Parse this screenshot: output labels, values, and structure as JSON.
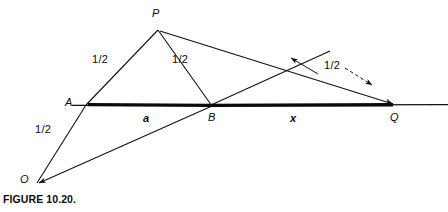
{
  "figure": {
    "caption": "FIGURE 10.20.",
    "points": [
      {
        "id": "P",
        "label": "P",
        "x": 158,
        "y": 29,
        "label_x": 153,
        "label_y": 10
      },
      {
        "id": "A",
        "label": "A",
        "x": 86,
        "y": 105,
        "label_x": 66,
        "label_y": 99
      },
      {
        "id": "B",
        "label": "B",
        "x": 212,
        "y": 106,
        "label_x": 209,
        "label_y": 114
      },
      {
        "id": "Q",
        "label": "Q",
        "x": 395,
        "y": 105,
        "label_x": 391,
        "label_y": 114
      },
      {
        "id": "O",
        "label": "O",
        "x": 37,
        "y": 183,
        "label_x": 21,
        "label_y": 176
      }
    ],
    "length_labels": [
      {
        "id": "half-AP",
        "text": "1/2",
        "x": 99,
        "y": 57
      },
      {
        "id": "half-PB",
        "text": "1/2",
        "x": 178,
        "y": 57
      },
      {
        "id": "half-OA",
        "text": "1/2",
        "x": 41,
        "y": 127
      },
      {
        "id": "half-arrow",
        "text": "1/2",
        "x": 330,
        "y": 64
      }
    ],
    "segment_labels": [
      {
        "id": "a",
        "text": "a",
        "x": 144,
        "y": 114
      },
      {
        "id": "x",
        "text": "x",
        "x": 291,
        "y": 114
      }
    ],
    "colors": {
      "ink": "#111111",
      "background": "#ffffff",
      "baseline_bold": "#0a0a0a"
    },
    "stroke_widths": {
      "thin": 1,
      "bold_segment": 3.2,
      "thin_line": 1
    }
  }
}
